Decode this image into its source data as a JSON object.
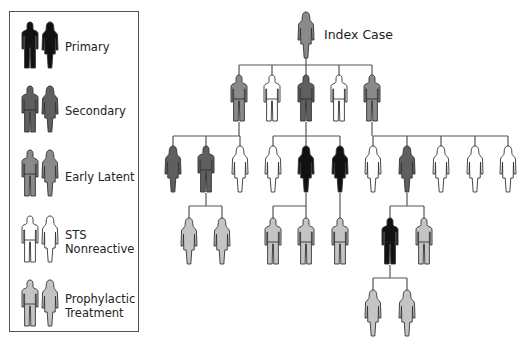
{
  "colors": {
    "primary": "#111111",
    "secondary": "#5f5f5f",
    "early_latent": "#8a8a8a",
    "nonreactive": "#ffffff",
    "prophylactic": "#c4c4c4",
    "outline": "#333333",
    "line": "#555555"
  },
  "legend": {
    "items": [
      {
        "key": "primary",
        "label": "Primary"
      },
      {
        "key": "secondary",
        "label": "Secondary"
      },
      {
        "key": "early_latent",
        "label": "Early Latent"
      },
      {
        "key": "nonreactive",
        "label": "STS Nonreactive",
        "line1": "STS",
        "line2": "Nonreactive"
      },
      {
        "key": "prophylactic",
        "label": "Prophylactic Treatment",
        "line1": "Prophylactic",
        "line2": "Treatment"
      }
    ]
  },
  "tree": {
    "index_label": "Index Case",
    "index": {
      "sex": "female",
      "status": "early_latent"
    },
    "level1": [
      {
        "sex": "male",
        "status": "early_latent"
      },
      {
        "sex": "male",
        "status": "nonreactive"
      },
      {
        "sex": "male",
        "status": "secondary"
      },
      {
        "sex": "male",
        "status": "nonreactive"
      },
      {
        "sex": "male",
        "status": "early_latent"
      }
    ],
    "level2_groups": [
      {
        "parent": 0,
        "members": [
          {
            "sex": "female",
            "status": "secondary"
          },
          {
            "sex": "male",
            "status": "secondary"
          },
          {
            "sex": "female",
            "status": "nonreactive"
          }
        ]
      },
      {
        "parent": 2,
        "members": [
          {
            "sex": "female",
            "status": "nonreactive"
          },
          {
            "sex": "female",
            "status": "primary"
          },
          {
            "sex": "female",
            "status": "primary"
          }
        ]
      },
      {
        "parent": 4,
        "members": [
          {
            "sex": "female",
            "status": "nonreactive"
          },
          {
            "sex": "female",
            "status": "secondary"
          },
          {
            "sex": "female",
            "status": "nonreactive"
          },
          {
            "sex": "female",
            "status": "nonreactive"
          },
          {
            "sex": "female",
            "status": "nonreactive"
          }
        ]
      }
    ],
    "level3": [
      {
        "parent": "A2",
        "members": [
          {
            "sex": "female",
            "status": "prophylactic"
          },
          {
            "sex": "female",
            "status": "prophylactic"
          }
        ]
      },
      {
        "parent": "B2",
        "members": [
          {
            "sex": "male",
            "status": "prophylactic"
          },
          {
            "sex": "male",
            "status": "prophylactic"
          }
        ]
      },
      {
        "parent": "B3",
        "members": [
          {
            "sex": "male",
            "status": "prophylactic"
          }
        ]
      },
      {
        "parent": "C2",
        "members": [
          {
            "sex": "male",
            "status": "primary"
          },
          {
            "sex": "male",
            "status": "prophylactic"
          }
        ]
      }
    ],
    "level4": [
      {
        "parent": "C2-primary-male",
        "members": [
          {
            "sex": "female",
            "status": "prophylactic"
          },
          {
            "sex": "female",
            "status": "prophylactic"
          }
        ]
      }
    ]
  }
}
